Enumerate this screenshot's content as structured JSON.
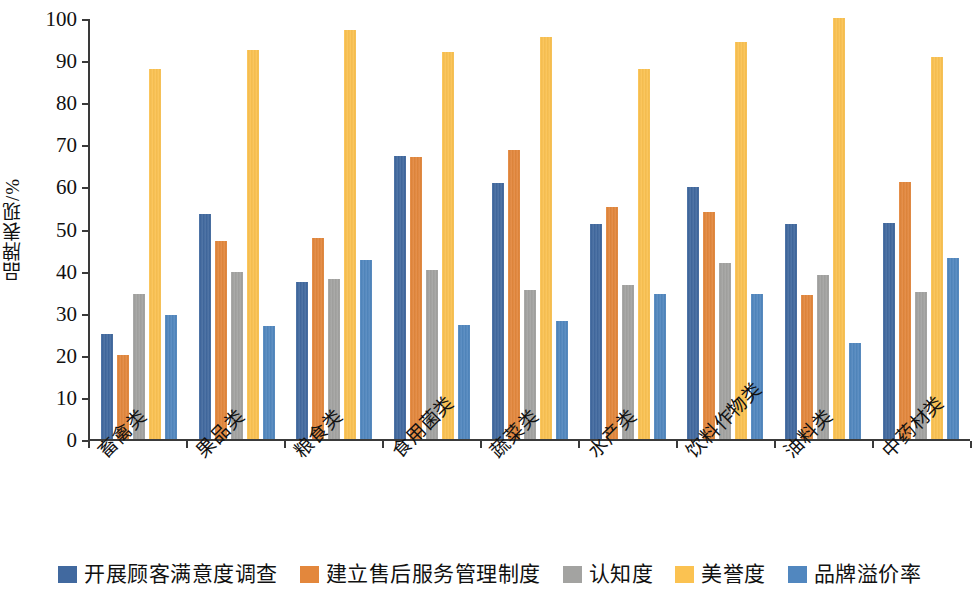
{
  "chart_data": {
    "type": "bar",
    "title": "",
    "subtitle": "",
    "xlabel": "",
    "ylabel": "品牌表现/%",
    "ylim": [
      0,
      100
    ],
    "yticks": [
      0,
      10,
      20,
      30,
      40,
      50,
      60,
      70,
      80,
      90,
      100
    ],
    "ytick_labels": [
      "0",
      "10",
      "20",
      "30",
      "40",
      "50",
      "60",
      "70",
      "80",
      "90",
      "100"
    ],
    "grid": false,
    "legend_position": "bottom",
    "categories": [
      "畜禽类",
      "果品类",
      "粮食类",
      "食用菌类",
      "蔬菜类",
      "水产类",
      "饮料作物类",
      "油料类",
      "中药材类"
    ],
    "series": [
      {
        "name": "开展顾客满意度调查",
        "color": "#41699f",
        "values": [
          25.0,
          53.5,
          37.2,
          67.3,
          60.8,
          51.0,
          59.8,
          51.0,
          51.4
        ]
      },
      {
        "name": "建立售后服务管理制度",
        "color": "#e3873c",
        "values": [
          19.9,
          47.0,
          47.7,
          67.0,
          68.6,
          55.2,
          53.9,
          34.3,
          61.1
        ]
      },
      {
        "name": "认知度",
        "color": "#a3a3a1",
        "values": [
          34.4,
          39.6,
          38.0,
          40.2,
          35.4,
          36.5,
          41.7,
          38.9,
          35.0
        ]
      },
      {
        "name": "美誉度",
        "color": "#fbc251",
        "values": [
          88.0,
          92.4,
          97.2,
          91.9,
          95.5,
          88.0,
          94.2,
          100.0,
          90.8
        ]
      },
      {
        "name": "品牌溢价率",
        "color": "#5187bf",
        "values": [
          29.5,
          26.8,
          42.6,
          27.2,
          28.1,
          34.4,
          34.4,
          22.8,
          42.9
        ]
      }
    ]
  },
  "axis": {
    "y_title": "品牌表现/%"
  }
}
